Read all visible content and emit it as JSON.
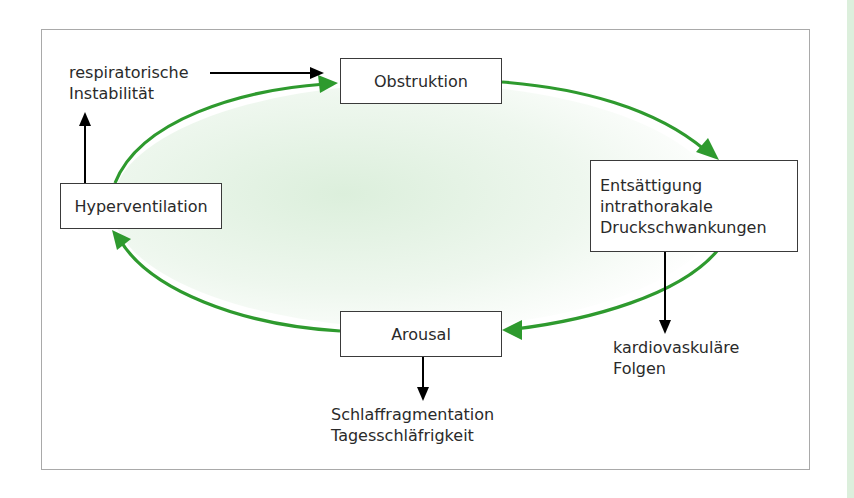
{
  "diagram": {
    "type": "cycle",
    "colors": {
      "cycle_arrow": "#2e9a2e",
      "fill": "#e6f4e6",
      "side_arrow": "#000000",
      "box_border": "#3a3a3a",
      "frame_border": "#a9a9a9",
      "side_strip": "#dcefdc"
    },
    "nodes": {
      "obstruktion": {
        "label": "Obstruktion"
      },
      "entsaettigung": {
        "lines": [
          "Entsättigung",
          "intrathorakale",
          "Druckschwankungen"
        ]
      },
      "arousal": {
        "label": "Arousal"
      },
      "hyperventilation": {
        "label": "Hyperventilation"
      }
    },
    "outputs": {
      "respiratorisch": {
        "lines": [
          "respiratorische",
          "Instabilität"
        ]
      },
      "kardiovaskulaer": {
        "lines": [
          "kardiovaskuläre",
          "Folgen"
        ]
      },
      "schlaf": {
        "lines": [
          "Schlaffragmentation",
          "Tagesschläfrigkeit"
        ]
      }
    },
    "edges": [
      {
        "from": "Obstruktion",
        "to": "Entsättigung intrathorakale Druckschwankungen",
        "style": "green-cycle"
      },
      {
        "from": "Entsättigung intrathorakale Druckschwankungen",
        "to": "Arousal",
        "style": "green-cycle"
      },
      {
        "from": "Arousal",
        "to": "Hyperventilation",
        "style": "green-cycle"
      },
      {
        "from": "Hyperventilation",
        "to": "Obstruktion",
        "style": "green-cycle"
      },
      {
        "from": "Hyperventilation",
        "to": "respiratorische Instabilität",
        "style": "black"
      },
      {
        "from": "respiratorische Instabilität",
        "to": "Obstruktion",
        "style": "black"
      },
      {
        "from": "Entsättigung intrathorakale Druckschwankungen",
        "to": "kardiovaskuläre Folgen",
        "style": "black"
      },
      {
        "from": "Arousal",
        "to": "Schlaffragmentation Tagesschläfrigkeit",
        "style": "black"
      }
    ]
  }
}
